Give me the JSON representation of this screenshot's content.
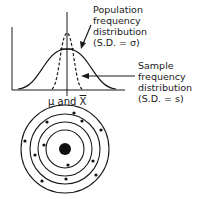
{
  "diagram": {
    "population_label": {
      "lines": [
        "Population",
        "frequency",
        "distribution",
        "(S.D. = σ)"
      ]
    },
    "sample_label": {
      "lines": [
        "Sample",
        "frequency",
        "distribution",
        "(S.D. = s)"
      ]
    },
    "mean_label": {
      "prefix": "μ and ",
      "xbar": "X"
    },
    "curves": [
      {
        "name": "population",
        "style": "solid",
        "relative_spread": "wide"
      },
      {
        "name": "sample",
        "style": "dashed",
        "relative_spread": "narrow"
      }
    ],
    "target": {
      "rings": 4,
      "bullseye": true,
      "shots": 12
    }
  }
}
